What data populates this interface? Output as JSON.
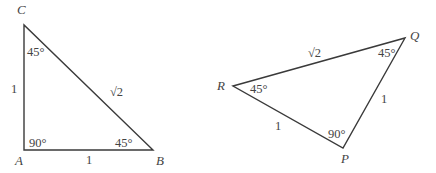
{
  "figure": {
    "triangles": [
      {
        "name": "ABC",
        "vertices": {
          "A": {
            "label": "A",
            "angle": "90°"
          },
          "B": {
            "label": "B",
            "angle": "45°"
          },
          "C": {
            "label": "C",
            "angle": "45°"
          }
        },
        "sides": {
          "AC": "1",
          "AB": "1",
          "BC": "√2"
        }
      },
      {
        "name": "PQR",
        "vertices": {
          "P": {
            "label": "P",
            "angle": "90°"
          },
          "Q": {
            "label": "Q",
            "angle": "45°"
          },
          "R": {
            "label": "R",
            "angle": "45°"
          }
        },
        "sides": {
          "RP": "1",
          "PQ": "1",
          "RQ": "√2"
        }
      }
    ]
  }
}
